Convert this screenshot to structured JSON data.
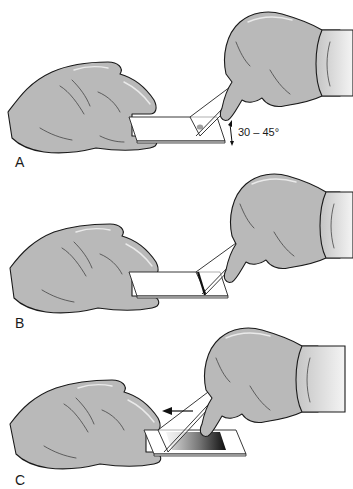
{
  "figure": {
    "panels": [
      {
        "id": "A",
        "label": "A",
        "annotation": "30 – 45°",
        "description": "Spreader slide placed at an angle in front of the blood drop on the stationary slide"
      },
      {
        "id": "B",
        "label": "B",
        "annotation": "",
        "description": "Spreader slide pulled back into the drop so blood spreads along its edge"
      },
      {
        "id": "C",
        "label": "C",
        "annotation": "",
        "description": "Spreader slide pushed forward, producing a feathered smear",
        "arrow_direction": "left"
      }
    ],
    "colors": {
      "glove": "#b9b9b9",
      "outline": "#1a1a1a",
      "smear_dark": "#111111",
      "smear_light": "#d8d8d8",
      "background": "#ffffff"
    }
  }
}
